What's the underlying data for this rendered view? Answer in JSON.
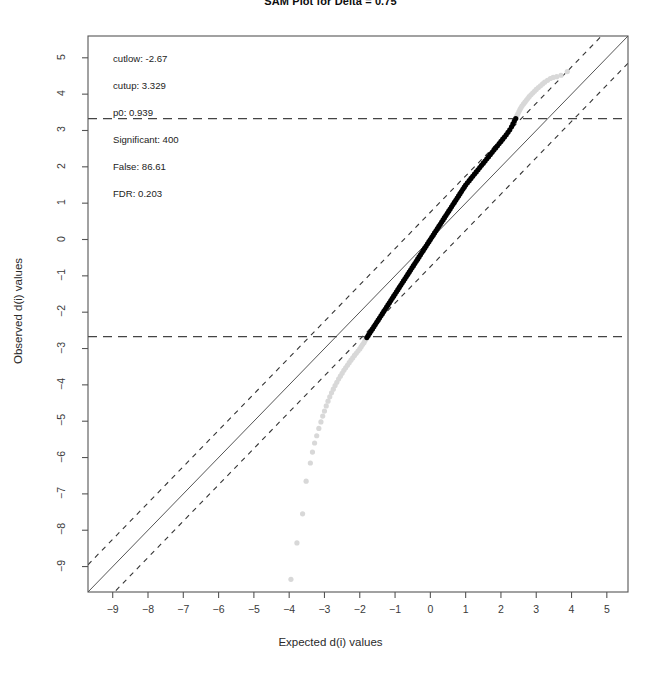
{
  "figure": {
    "title": "SAM Plot for Delta = 0.75",
    "xlabel": "Expected d(i) values",
    "ylabel": "Observed d(i) values"
  },
  "annotations": {
    "cutlow": "cutlow:  -2.67",
    "cutup": "cutup:  3.329",
    "p0": "p0:  0.939",
    "significant": "Significant:  400",
    "false": "False:  86.61",
    "fdr": "FDR:  0.203"
  },
  "chart_data": {
    "type": "scatter",
    "title": "SAM Plot for Delta = 0.75",
    "xlabel": "Expected d(i) values",
    "ylabel": "Observed d(i) values",
    "xlim": [
      -9.7,
      5.6
    ],
    "ylim": [
      -9.7,
      5.6
    ],
    "xticks": [
      -9,
      -8,
      -7,
      -6,
      -5,
      -4,
      -3,
      -2,
      -1,
      0,
      1,
      2,
      3,
      4,
      5
    ],
    "yticks": [
      -9,
      -8,
      -7,
      -6,
      -5,
      -4,
      -3,
      -2,
      -1,
      0,
      1,
      2,
      3,
      4,
      5
    ],
    "xticklabels": [
      "-9",
      "-8",
      "-7",
      "-6",
      "-5",
      "-4",
      "-3",
      "-2",
      "-1",
      "0",
      "1",
      "2",
      "3",
      "4",
      "5"
    ],
    "yticklabels": [
      "-9",
      "-8",
      "-7",
      "-6",
      "-5",
      "-4",
      "-3",
      "-2",
      "-1",
      "0",
      "1",
      "2",
      "3",
      "4",
      "5"
    ],
    "grid": false,
    "legend": null,
    "delta": 0.75,
    "cutlow": -2.67,
    "cutup": 3.329,
    "p0": 0.939,
    "significant": 400,
    "false_positives": 86.61,
    "fdr": 0.203,
    "reference_lines": [
      {
        "name": "identity",
        "type": "line",
        "slope": 1,
        "intercept": 0,
        "style": "solid",
        "color": "#555555"
      },
      {
        "name": "upper-delta-band",
        "type": "line",
        "slope": 1,
        "intercept": 0.75,
        "style": "dashed",
        "color": "#333333"
      },
      {
        "name": "lower-delta-band",
        "type": "line",
        "slope": 1,
        "intercept": -0.75,
        "style": "dashed",
        "color": "#333333"
      },
      {
        "name": "cutup-threshold",
        "type": "hline",
        "y": 3.329,
        "style": "dashed",
        "color": "#444444"
      },
      {
        "name": "cutlow-threshold",
        "type": "hline",
        "y": -2.67,
        "style": "dashed",
        "color": "#444444"
      }
    ],
    "series": [
      {
        "name": "non-significant (gray)",
        "color": "#d8d8d8",
        "points": [
          [
            -3.95,
            -9.35
          ],
          [
            -3.78,
            -8.35
          ],
          [
            -3.62,
            -7.55
          ],
          [
            -3.52,
            -6.65
          ],
          [
            -3.4,
            -6.15
          ],
          [
            -3.34,
            -5.85
          ],
          [
            -3.28,
            -5.6
          ],
          [
            -3.22,
            -5.4
          ],
          [
            -3.16,
            -5.2
          ],
          [
            -3.1,
            -5.02
          ],
          [
            -3.05,
            -4.86
          ],
          [
            -3.0,
            -4.72
          ],
          [
            -2.95,
            -4.58
          ],
          [
            -2.9,
            -4.45
          ],
          [
            -2.85,
            -4.33
          ],
          [
            -2.8,
            -4.22
          ],
          [
            -2.75,
            -4.12
          ],
          [
            -2.7,
            -4.02
          ],
          [
            -2.65,
            -3.93
          ],
          [
            -2.6,
            -3.84
          ],
          [
            -2.55,
            -3.76
          ],
          [
            -2.5,
            -3.68
          ],
          [
            -2.45,
            -3.6
          ],
          [
            -2.4,
            -3.53
          ],
          [
            -2.35,
            -3.46
          ],
          [
            -2.3,
            -3.39
          ],
          [
            -2.25,
            -3.32
          ],
          [
            -2.2,
            -3.26
          ],
          [
            -2.15,
            -3.19
          ],
          [
            -2.1,
            -3.13
          ],
          [
            -2.05,
            -3.07
          ],
          [
            -2.0,
            -3.01
          ],
          [
            -1.96,
            -2.95
          ],
          [
            -1.92,
            -2.89
          ],
          [
            -1.88,
            -2.84
          ],
          [
            -1.85,
            -2.78
          ],
          [
            -1.82,
            -2.73
          ],
          [
            -1.8,
            -2.7
          ],
          [
            2.42,
            3.34
          ],
          [
            2.45,
            3.4
          ],
          [
            2.48,
            3.46
          ],
          [
            2.51,
            3.52
          ],
          [
            2.54,
            3.58
          ],
          [
            2.57,
            3.63
          ],
          [
            2.6,
            3.68
          ],
          [
            2.64,
            3.73
          ],
          [
            2.68,
            3.78
          ],
          [
            2.72,
            3.83
          ],
          [
            2.76,
            3.88
          ],
          [
            2.8,
            3.93
          ],
          [
            2.85,
            3.98
          ],
          [
            2.9,
            4.03
          ],
          [
            2.95,
            4.08
          ],
          [
            3.0,
            4.13
          ],
          [
            3.06,
            4.18
          ],
          [
            3.12,
            4.23
          ],
          [
            3.18,
            4.28
          ],
          [
            3.24,
            4.33
          ],
          [
            3.32,
            4.38
          ],
          [
            3.4,
            4.43
          ],
          [
            3.48,
            4.46
          ],
          [
            3.58,
            4.48
          ],
          [
            3.7,
            4.52
          ],
          [
            3.88,
            4.62
          ]
        ]
      },
      {
        "name": "significant (black)",
        "color": "#000000",
        "points": [
          [
            -1.8,
            -2.7
          ],
          [
            -1.76,
            -2.64
          ],
          [
            -1.72,
            -2.58
          ],
          [
            -1.68,
            -2.52
          ],
          [
            -1.64,
            -2.46
          ],
          [
            -1.6,
            -2.4
          ],
          [
            -1.56,
            -2.34
          ],
          [
            -1.52,
            -2.28
          ],
          [
            -1.48,
            -2.22
          ],
          [
            -1.44,
            -2.16
          ],
          [
            -1.4,
            -2.1
          ],
          [
            -1.36,
            -2.04
          ],
          [
            -1.32,
            -1.98
          ],
          [
            -1.28,
            -1.92
          ],
          [
            -1.24,
            -1.86
          ],
          [
            -1.2,
            -1.8
          ],
          [
            -1.16,
            -1.74
          ],
          [
            -1.12,
            -1.68
          ],
          [
            -1.08,
            -1.62
          ],
          [
            -1.04,
            -1.56
          ],
          [
            -1.0,
            -1.5
          ],
          [
            -0.96,
            -1.44
          ],
          [
            -0.92,
            -1.38
          ],
          [
            -0.88,
            -1.32
          ],
          [
            -0.84,
            -1.26
          ],
          [
            -0.8,
            -1.2
          ],
          [
            -0.76,
            -1.14
          ],
          [
            -0.72,
            -1.08
          ],
          [
            -0.68,
            -1.02
          ],
          [
            -0.64,
            -0.96
          ],
          [
            -0.6,
            -0.9
          ],
          [
            -0.56,
            -0.84
          ],
          [
            -0.52,
            -0.78
          ],
          [
            -0.48,
            -0.72
          ],
          [
            -0.44,
            -0.66
          ],
          [
            -0.4,
            -0.6
          ],
          [
            -0.36,
            -0.54
          ],
          [
            -0.32,
            -0.48
          ],
          [
            -0.28,
            -0.42
          ],
          [
            -0.24,
            -0.36
          ],
          [
            -0.2,
            -0.3
          ],
          [
            -0.16,
            -0.24
          ],
          [
            -0.12,
            -0.18
          ],
          [
            -0.08,
            -0.12
          ],
          [
            -0.04,
            -0.06
          ],
          [
            0.0,
            0.0
          ],
          [
            0.04,
            0.06
          ],
          [
            0.08,
            0.12
          ],
          [
            0.12,
            0.18
          ],
          [
            0.16,
            0.24
          ],
          [
            0.2,
            0.3
          ],
          [
            0.24,
            0.36
          ],
          [
            0.28,
            0.42
          ],
          [
            0.32,
            0.48
          ],
          [
            0.36,
            0.54
          ],
          [
            0.4,
            0.6
          ],
          [
            0.44,
            0.66
          ],
          [
            0.48,
            0.72
          ],
          [
            0.52,
            0.78
          ],
          [
            0.56,
            0.84
          ],
          [
            0.6,
            0.9
          ],
          [
            0.64,
            0.96
          ],
          [
            0.68,
            1.02
          ],
          [
            0.72,
            1.08
          ],
          [
            0.76,
            1.14
          ],
          [
            0.8,
            1.2
          ],
          [
            0.84,
            1.26
          ],
          [
            0.88,
            1.32
          ],
          [
            0.92,
            1.38
          ],
          [
            0.96,
            1.44
          ],
          [
            1.0,
            1.5
          ],
          [
            1.05,
            1.56
          ],
          [
            1.1,
            1.62
          ],
          [
            1.15,
            1.68
          ],
          [
            1.2,
            1.74
          ],
          [
            1.25,
            1.8
          ],
          [
            1.3,
            1.86
          ],
          [
            1.35,
            1.92
          ],
          [
            1.4,
            1.98
          ],
          [
            1.45,
            2.04
          ],
          [
            1.5,
            2.1
          ],
          [
            1.55,
            2.16
          ],
          [
            1.6,
            2.22
          ],
          [
            1.65,
            2.28
          ],
          [
            1.7,
            2.34
          ],
          [
            1.75,
            2.4
          ],
          [
            1.8,
            2.46
          ],
          [
            1.85,
            2.52
          ],
          [
            1.9,
            2.58
          ],
          [
            1.95,
            2.64
          ],
          [
            2.0,
            2.7
          ],
          [
            2.05,
            2.76
          ],
          [
            2.1,
            2.82
          ],
          [
            2.15,
            2.88
          ],
          [
            2.2,
            2.95
          ],
          [
            2.25,
            3.02
          ],
          [
            2.3,
            3.1
          ],
          [
            2.34,
            3.18
          ],
          [
            2.38,
            3.26
          ],
          [
            2.42,
            3.33
          ]
        ]
      }
    ]
  }
}
